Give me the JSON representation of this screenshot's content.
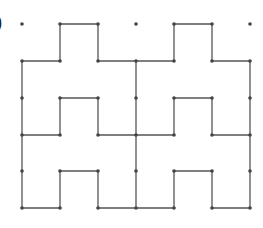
{
  "figure": {
    "label": "(b)",
    "visible_label": ")",
    "grid": {
      "columns_x": [
        22,
        60,
        98,
        136,
        174,
        212,
        250
      ],
      "rows_y": [
        24,
        61,
        98,
        135,
        171,
        208
      ]
    },
    "colors": {
      "line": "#555555",
      "dot": "#444444",
      "background": "#ffffff"
    },
    "segments": [
      [
        0,
        1,
        1,
        1
      ],
      [
        1,
        1,
        1,
        0
      ],
      [
        1,
        0,
        2,
        0
      ],
      [
        2,
        0,
        2,
        1
      ],
      [
        2,
        1,
        4,
        1
      ],
      [
        4,
        1,
        4,
        0
      ],
      [
        4,
        0,
        5,
        0
      ],
      [
        5,
        0,
        5,
        1
      ],
      [
        5,
        1,
        6,
        1
      ],
      [
        0,
        1,
        0,
        5
      ],
      [
        3,
        1,
        3,
        5
      ],
      [
        6,
        1,
        6,
        5
      ],
      [
        1,
        2,
        2,
        2
      ],
      [
        1,
        2,
        1,
        3
      ],
      [
        2,
        2,
        2,
        3
      ],
      [
        4,
        2,
        5,
        2
      ],
      [
        4,
        2,
        4,
        3
      ],
      [
        5,
        2,
        5,
        3
      ],
      [
        0,
        3,
        1,
        3
      ],
      [
        2,
        3,
        4,
        3
      ],
      [
        5,
        3,
        6,
        3
      ],
      [
        1,
        4,
        2,
        4
      ],
      [
        1,
        4,
        1,
        5
      ],
      [
        2,
        4,
        2,
        5
      ],
      [
        4,
        4,
        5,
        4
      ],
      [
        4,
        4,
        4,
        5
      ],
      [
        5,
        4,
        5,
        5
      ],
      [
        0,
        5,
        1,
        5
      ],
      [
        2,
        5,
        4,
        5
      ],
      [
        5,
        5,
        6,
        5
      ]
    ],
    "dots": [
      [
        0,
        0
      ],
      [
        1,
        0
      ],
      [
        2,
        0
      ],
      [
        3,
        0
      ],
      [
        4,
        0
      ],
      [
        5,
        0
      ],
      [
        6,
        0
      ],
      [
        0,
        1
      ],
      [
        1,
        1
      ],
      [
        2,
        1
      ],
      [
        3,
        1
      ],
      [
        4,
        1
      ],
      [
        5,
        1
      ],
      [
        6,
        1
      ],
      [
        0,
        2
      ],
      [
        1,
        2
      ],
      [
        2,
        2
      ],
      [
        3,
        2
      ],
      [
        4,
        2
      ],
      [
        5,
        2
      ],
      [
        6,
        2
      ],
      [
        0,
        3
      ],
      [
        1,
        3
      ],
      [
        2,
        3
      ],
      [
        3,
        3
      ],
      [
        4,
        3
      ],
      [
        5,
        3
      ],
      [
        6,
        3
      ],
      [
        0,
        4
      ],
      [
        1,
        4
      ],
      [
        2,
        4
      ],
      [
        3,
        4
      ],
      [
        4,
        4
      ],
      [
        5,
        4
      ],
      [
        6,
        4
      ],
      [
        0,
        5
      ],
      [
        1,
        5
      ],
      [
        2,
        5
      ],
      [
        3,
        5
      ],
      [
        4,
        5
      ],
      [
        5,
        5
      ],
      [
        6,
        5
      ]
    ]
  }
}
